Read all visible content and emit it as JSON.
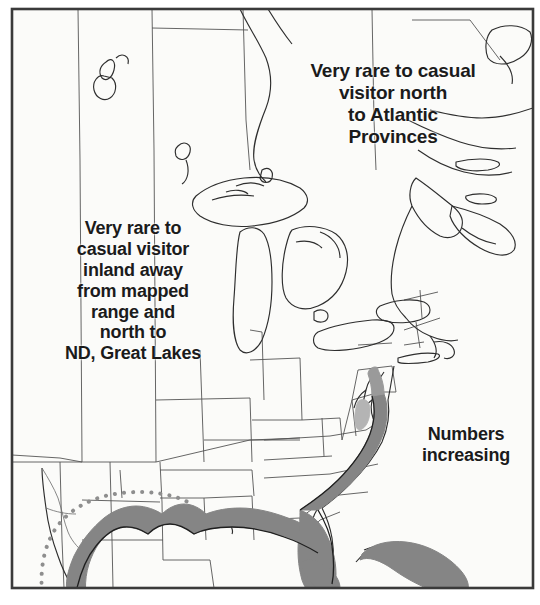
{
  "figure": {
    "kind": "species-range-map",
    "region": "eastern North America",
    "frame": {
      "color": "#3a3a3a",
      "visible": true
    },
    "background_color": "#fdfdfc"
  },
  "annotations": [
    {
      "id": "north",
      "name": "annotation-atlantic-provinces",
      "text": "Very rare to casual\nvisitor north\nto Atlantic\nProvinces"
    },
    {
      "id": "inland",
      "name": "annotation-inland-nd-great-lakes",
      "text": "Very rare to\ncasual visitor\ninland away\nfrom mapped\nrange and\nnorth to\nND, Great Lakes"
    },
    {
      "id": "numbers",
      "name": "annotation-numbers-increasing",
      "text": "Numbers\nincreasing"
    }
  ],
  "legend_implicit": {
    "range_fill_label": "mapped range",
    "range_fill_color": "#858585",
    "range_outline_color": "#2b2b2b",
    "extension_line_label": "casual / extended range boundary",
    "extension_line_color": "#8a8a8a",
    "extension_line_style": "dotted",
    "boundary_line_color": "#4a4a4a",
    "coastline_color": "#2e2e2e"
  },
  "map_features": {
    "water_bodies": [
      "Lake Winnipeg",
      "Lake Superior",
      "Lake Michigan",
      "Lake Huron",
      "Lake Erie",
      "Lake Ontario",
      "Hudson Bay inlet",
      "Gulf of St. Lawrence",
      "Chesapeake Bay",
      "Gulf of Mexico",
      "Atlantic Ocean"
    ],
    "shaded_range_segments": [
      "Texas Gulf coast",
      "Louisiana Gulf coast",
      "Mississippi / Alabama Gulf coast",
      "Florida panhandle",
      "Florida peninsula (entire)",
      "Georgia coast",
      "South Carolina coast",
      "North Carolina coast",
      "Virginia / Chesapeake",
      "Delmarva and New Jersey coast",
      "Bahamas / Cuba"
    ]
  }
}
